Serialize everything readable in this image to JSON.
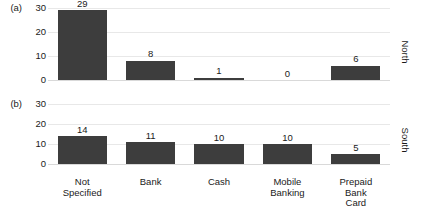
{
  "chart_data": {
    "type": "bar",
    "title": "",
    "subtitle": "",
    "xlabel": "",
    "ylabel": "",
    "categories": [
      "Not Specified",
      "Bank",
      "Cash",
      "Mobile Banking",
      "Prepaid Bank Card"
    ],
    "category_lines": [
      [
        "Not",
        "Specified"
      ],
      [
        "Bank"
      ],
      [
        "Cash"
      ],
      [
        "Mobile",
        "Banking"
      ],
      [
        "Prepaid",
        "Bank",
        "Card"
      ]
    ],
    "ylim": [
      0,
      30
    ],
    "yticks": [
      30,
      20,
      10,
      0
    ],
    "grid": true,
    "legend": "none",
    "orientation": "vertical",
    "bar_color": "#3d3d3d",
    "grid_color": "#e8e8e8",
    "panels": [
      {
        "tag": "(a)",
        "side_label": "North",
        "values": [
          29,
          8,
          1,
          0,
          6
        ],
        "value_labels": [
          "29",
          "8",
          "1",
          "0",
          "6"
        ],
        "yticks": [
          "30",
          "20",
          "10",
          "0"
        ]
      },
      {
        "tag": "(b)",
        "side_label": "South",
        "values": [
          14,
          11,
          10,
          10,
          5
        ],
        "value_labels": [
          "14",
          "11",
          "10",
          "10",
          "5"
        ],
        "yticks": [
          "30",
          "20",
          "10",
          "0"
        ]
      }
    ],
    "series": [
      {
        "name": "North",
        "values": [
          29,
          8,
          1,
          0,
          6
        ]
      },
      {
        "name": "South",
        "values": [
          14,
          11,
          10,
          10,
          5
        ]
      }
    ]
  }
}
